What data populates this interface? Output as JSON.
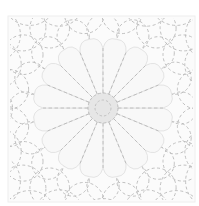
{
  "image": {
    "subject": "sashiko quilting pattern with dashed-stitch flower motif",
    "colors": {
      "background": "#ffffff",
      "block": "#fbfbfb",
      "block_border": "#eeeeee",
      "petal_fill": "#f8f8f8",
      "petal_outline": "#e4e4e4",
      "stitch": "#b9b9b9",
      "center_fill": "#e6e6e6"
    },
    "block": {
      "x": 8,
      "y": 16,
      "width": 187,
      "height": 186
    },
    "flower": {
      "cx": 103,
      "cy": 108,
      "petal_count": 16,
      "petal_outer_radius": 70,
      "center_radius": 15,
      "center_inner_radius": 8
    },
    "background_scallops": {
      "rings": [
        78,
        96
      ],
      "count": 16
    }
  }
}
